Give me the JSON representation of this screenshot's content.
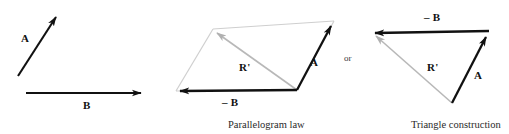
{
  "figure": {
    "background_color": "#ffffff",
    "ink_color": "#111111",
    "resultant_color": "#b8b8b8",
    "width": 509,
    "height": 134
  },
  "panels": {
    "given": {
      "name": "given-vectors",
      "vectors": [
        {
          "label": "A",
          "label_x": 21,
          "label_y": 33,
          "from_x": 18,
          "from_y": 76,
          "to_x": 59,
          "to_y": 12,
          "style": "solid-black"
        },
        {
          "label": "B",
          "label_x": 83,
          "label_y": 100,
          "from_x": 26,
          "from_y": 93,
          "to_x": 144,
          "to_y": 93,
          "style": "solid-black"
        }
      ]
    },
    "parallelogram": {
      "name": "parallelogram-law",
      "caption": "Parallelogram law",
      "caption_x": 228,
      "caption_y": 120,
      "vertices": {
        "origin_x": 297,
        "origin_y": 90,
        "minus_b_tip_x": 176,
        "minus_b_tip_y": 91,
        "a_tip_x": 334,
        "a_tip_y": 19,
        "far_x": 213,
        "far_y": 29
      },
      "labels": [
        {
          "label": "A",
          "label_x": 310,
          "label_y": 57
        },
        {
          "label": "– B",
          "label_x": 222,
          "label_y": 97
        },
        {
          "label": "R'",
          "label_x": 239,
          "label_y": 62
        }
      ]
    },
    "conjunction": {
      "text": "or",
      "x": 344,
      "y": 54
    },
    "triangle": {
      "name": "triangle-construction",
      "caption": "Triangle construction",
      "caption_x": 411,
      "caption_y": 120,
      "vertices": {
        "origin_x": 452,
        "origin_y": 103,
        "a_tip_x": 489,
        "a_tip_y": 31,
        "minus_b_tip_x": 371,
        "minus_b_tip_y": 33
      },
      "labels": [
        {
          "label": "– B",
          "label_x": 424,
          "label_y": 12
        },
        {
          "label": "A",
          "label_x": 474,
          "label_y": 70
        },
        {
          "label": "R'",
          "label_x": 427,
          "label_y": 62
        }
      ]
    }
  }
}
